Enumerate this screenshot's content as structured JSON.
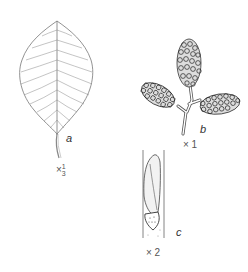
{
  "figure": {
    "panels": [
      {
        "id": "a",
        "label": "a",
        "subject": "leaf",
        "scale_prefix": "×",
        "scale_num": "1",
        "scale_den": "3"
      },
      {
        "id": "b",
        "label": "b",
        "subject": "cone-cluster",
        "scale": "× 1"
      },
      {
        "id": "c",
        "label": "c",
        "subject": "bud-on-twig",
        "scale": "× 2"
      }
    ]
  }
}
